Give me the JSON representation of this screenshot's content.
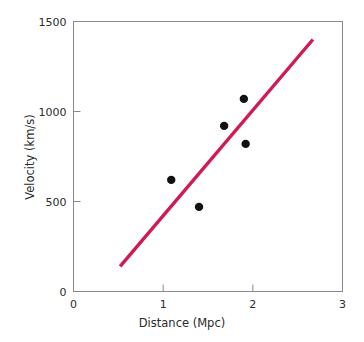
{
  "chart_data": {
    "type": "scatter",
    "title": "",
    "xlabel": "Distance (Mpc)",
    "ylabel": "Velocity (km/s)",
    "xlim": [
      0,
      3
    ],
    "ylim": [
      0,
      1500
    ],
    "xticks": [
      0,
      1,
      2,
      3
    ],
    "xtick_labels": [
      "0",
      "1",
      "2",
      "3"
    ],
    "yticks": [
      0,
      500,
      1000,
      1500
    ],
    "ytick_labels": [
      "0",
      "500",
      "1000",
      "1500"
    ],
    "grid": false,
    "legend": null,
    "series": [
      {
        "name": "galaxies",
        "marker": "filled-circle",
        "color": "#111111",
        "points": [
          {
            "x": 1.09,
            "y": 620
          },
          {
            "x": 1.4,
            "y": 470
          },
          {
            "x": 1.68,
            "y": 920
          },
          {
            "x": 1.92,
            "y": 820
          },
          {
            "x": 1.9,
            "y": 1070
          }
        ]
      },
      {
        "name": "fit-line",
        "type": "line",
        "color": "#d01a52",
        "x": [
          0.52,
          2.67
        ],
        "y": [
          140,
          1400
        ]
      }
    ],
    "frame_color": "#8a8a8a",
    "background": "#ffffff"
  },
  "axes": {
    "x_title": "Distance (Mpc)",
    "y_title": "Velocity (km/s)"
  }
}
